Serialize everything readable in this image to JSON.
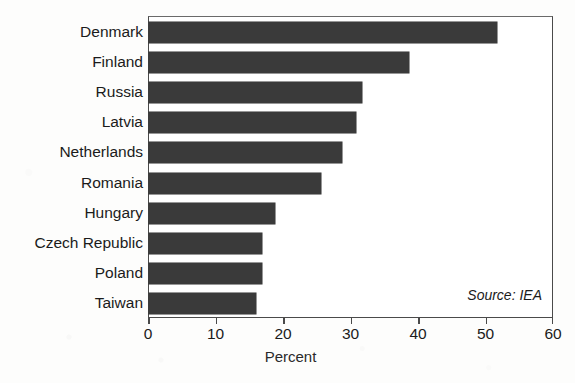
{
  "title_fragment": "Share of CHP in Power Generation",
  "source_note": "Source: IEA",
  "chart_data": {
    "type": "bar",
    "orientation": "horizontal",
    "title": "",
    "xlabel": "Percent",
    "ylabel": "",
    "xlim": [
      0,
      60
    ],
    "xticks": [
      0,
      10,
      20,
      30,
      40,
      50,
      60
    ],
    "grid": false,
    "legend": null,
    "bar_color": "#3a3a3a",
    "categories": [
      "Denmark",
      "Finland",
      "Russia",
      "Latvia",
      "Netherlands",
      "Romania",
      "Hungary",
      "Czech Republic",
      "Poland",
      "Taiwan"
    ],
    "values": [
      51.6,
      38.5,
      31.6,
      30.7,
      28.6,
      25.5,
      18.7,
      16.7,
      16.7,
      15.9
    ],
    "annotations": [
      "Source: IEA"
    ]
  }
}
